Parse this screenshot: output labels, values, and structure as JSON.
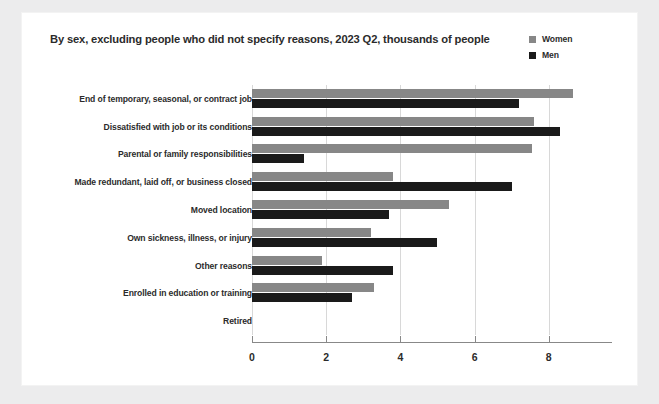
{
  "chart_data": {
    "type": "bar",
    "orientation": "horizontal",
    "grouped": true,
    "title": "By sex, excluding people who did not specify reasons, 2023 Q2, thousands of people",
    "xlabel": "",
    "ylabel": "",
    "xlim": [
      0,
      9.3
    ],
    "xticks": [
      0,
      2,
      4,
      6,
      8
    ],
    "xtick_labels": [
      "0",
      "2",
      "4",
      "6",
      "8"
    ],
    "grid": "vertical",
    "legend_position": "top-right",
    "categories": [
      "End of temporary, seasonal, or contract job",
      "Dissatisfied with job or its conditions",
      "Parental or family responsibilities",
      "Made redundant, laid off, or business closed",
      "Moved location",
      "Own sickness, illness, or injury",
      "Other reasons",
      "Enrolled in education or training",
      "Retired"
    ],
    "series": [
      {
        "name": "Women",
        "color": "#878787",
        "values": [
          8.65,
          7.6,
          7.55,
          3.8,
          5.3,
          3.2,
          1.9,
          3.3,
          0
        ]
      },
      {
        "name": "Men",
        "color": "#1a1a1a",
        "values": [
          7.2,
          8.3,
          1.4,
          7.0,
          3.7,
          5.0,
          3.8,
          2.7,
          0
        ]
      }
    ]
  },
  "legend": {
    "items": [
      {
        "label": "Women",
        "color": "#878787"
      },
      {
        "label": "Men",
        "color": "#1a1a1a"
      }
    ]
  },
  "theme": {
    "page_background": "#ececed",
    "card_background": "#ffffff",
    "text_color": "#2b2b2b",
    "grid_color": "#d8d8d8",
    "axis_color": "#888888"
  }
}
